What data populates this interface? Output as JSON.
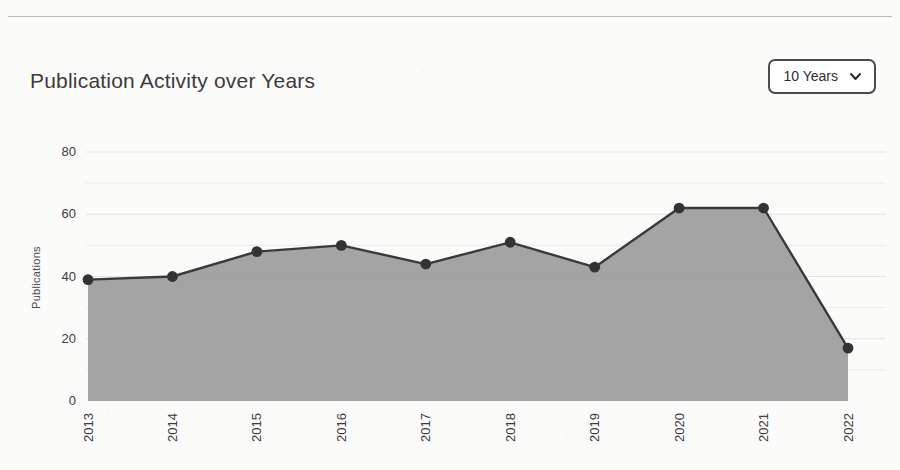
{
  "header": {
    "title": "Publication Activity over Years",
    "range_selector": {
      "value": "10 Years",
      "icon": "chevron-down-icon",
      "options": [
        "10 Years"
      ]
    }
  },
  "colors": {
    "area_fill": "#9c9c9c",
    "line": "#3a3a3a",
    "marker": "#333333",
    "grid": "#e3e3e3",
    "axis_text": "#3b3b3b",
    "card_background": "#fbfbfa",
    "select_border": "#4b4b4b"
  },
  "chart_data": {
    "type": "area",
    "title": "Publication Activity over Years",
    "xlabel": "",
    "ylabel": "Publications",
    "categories": [
      "2013",
      "2014",
      "2015",
      "2016",
      "2017",
      "2018",
      "2019",
      "2020",
      "2021",
      "2022"
    ],
    "values": [
      39,
      40,
      48,
      50,
      44,
      51,
      43,
      62,
      62,
      17
    ],
    "series": [
      {
        "name": "Publications",
        "values": [
          39,
          40,
          48,
          50,
          44,
          51,
          43,
          62,
          62,
          17
        ]
      }
    ],
    "ylim": [
      0,
      80
    ],
    "yticks": [
      0,
      20,
      40,
      60,
      80
    ],
    "ytick_labels": [
      "0",
      "20",
      "40",
      "60",
      "80"
    ],
    "gridlines": [
      10,
      20,
      30,
      40,
      50,
      60,
      70,
      80
    ],
    "grid": true,
    "legend": false,
    "markers": true,
    "xtick_rotation": 90
  }
}
